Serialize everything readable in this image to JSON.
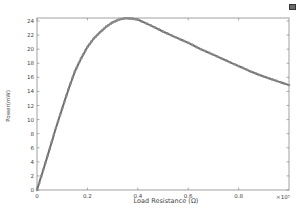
{
  "toolbar": {
    "icon": "export-image-icon"
  },
  "chart_data": {
    "type": "line",
    "title": "",
    "xlabel": "Load Resistance (Ω)",
    "ylabel": "Power(mW)",
    "x_multiplier_label": "×10⁵",
    "xlim": [
      0,
      1.0
    ],
    "ylim": [
      0,
      24.5
    ],
    "x_ticks": [
      0,
      0.2,
      0.4,
      0.6,
      0.8
    ],
    "x_tick_labels": [
      "0",
      "0.2",
      "0.4",
      "0.6",
      "0.8"
    ],
    "y_ticks": [
      0,
      2,
      4,
      6,
      8,
      10,
      12,
      14,
      16,
      18,
      20,
      22,
      24
    ],
    "y_tick_labels": [
      "0",
      "2",
      "4",
      "6",
      "8",
      "10",
      "12",
      "14",
      "16",
      "18",
      "20",
      "22",
      "24"
    ],
    "grid": false,
    "legend": null,
    "series": [
      {
        "name": "Power",
        "color": "#6e6e6e",
        "marker": "circle",
        "x": [
          0,
          0.025,
          0.05,
          0.075,
          0.1,
          0.125,
          0.15,
          0.175,
          0.2,
          0.225,
          0.25,
          0.275,
          0.3,
          0.325,
          0.35,
          0.375,
          0.4,
          0.45,
          0.5,
          0.55,
          0.6,
          0.65,
          0.7,
          0.75,
          0.8,
          0.85,
          0.9,
          0.95,
          1.0
        ],
        "values": [
          0,
          2.9,
          5.8,
          8.8,
          11.6,
          14.3,
          16.8,
          18.7,
          20.3,
          21.5,
          22.4,
          23.2,
          23.8,
          24.2,
          24.4,
          24.35,
          24.2,
          23.4,
          22.5,
          21.7,
          20.9,
          20.0,
          19.2,
          18.4,
          17.6,
          16.8,
          16.1,
          15.5,
          14.9
        ]
      }
    ]
  }
}
